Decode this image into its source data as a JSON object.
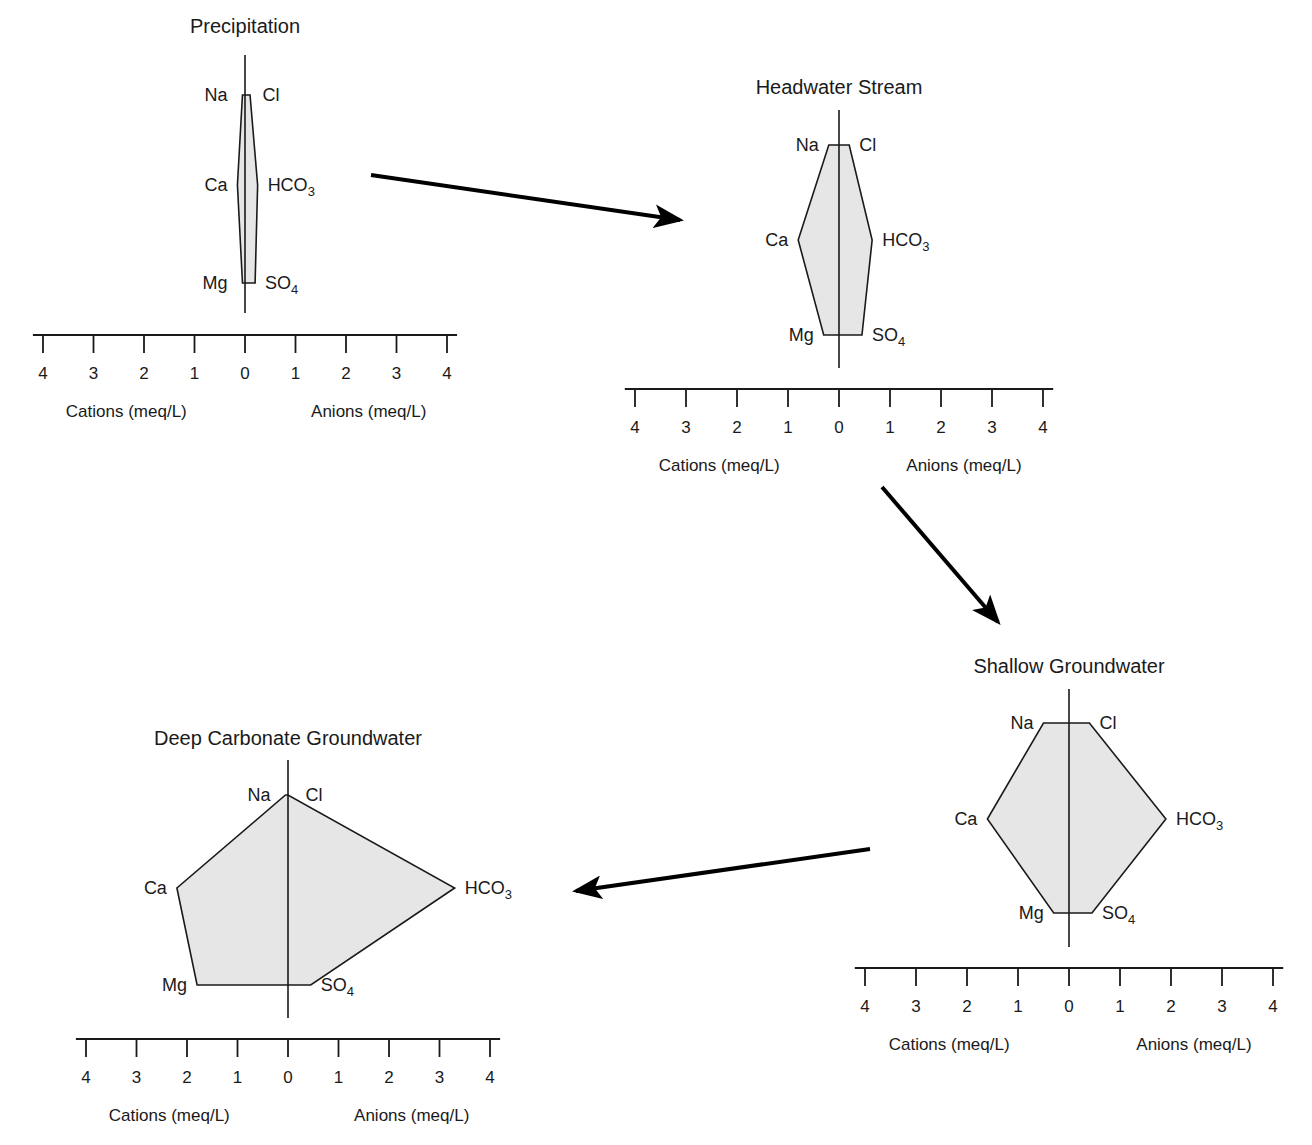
{
  "figure": {
    "ion_order": [
      [
        "Na",
        "Cl"
      ],
      [
        "Ca",
        "HCO3"
      ],
      [
        "Mg",
        "SO4"
      ]
    ],
    "axis": {
      "ticks": [
        "4",
        "3",
        "2",
        "1",
        "0",
        "1",
        "2",
        "3",
        "4"
      ],
      "cation_label": "Cations (meq/L)",
      "anion_label": "Anions (meq/L)"
    },
    "colors": {
      "fill": "#e6e6e6",
      "stroke": "#1a1a1a",
      "arrow": "#000000"
    }
  },
  "chart_data": [
    {
      "type": "stiff",
      "title": "Precipitation",
      "units": "meq/L",
      "xlim": [
        -4,
        4
      ],
      "cations": {
        "Na": 0.05,
        "Ca": 0.15,
        "Mg": 0.05
      },
      "anions": {
        "Cl": 0.1,
        "HCO3": 0.25,
        "SO4": 0.2
      },
      "xlabel_left": "Cations (meq/L)",
      "xlabel_right": "Anions (meq/L)"
    },
    {
      "type": "stiff",
      "title": "Headwater Stream",
      "units": "meq/L",
      "xlim": [
        -4,
        4
      ],
      "cations": {
        "Na": 0.2,
        "Ca": 0.8,
        "Mg": 0.3
      },
      "anions": {
        "Cl": 0.2,
        "HCO3": 0.65,
        "SO4": 0.45
      },
      "xlabel_left": "Cations (meq/L)",
      "xlabel_right": "Anions (meq/L)"
    },
    {
      "type": "stiff",
      "title": "Shallow Groundwater",
      "units": "meq/L",
      "xlim": [
        -4,
        4
      ],
      "cations": {
        "Na": 0.5,
        "Ca": 1.6,
        "Mg": 0.3
      },
      "anions": {
        "Cl": 0.4,
        "HCO3": 1.9,
        "SO4": 0.45
      },
      "xlabel_left": "Cations (meq/L)",
      "xlabel_right": "Anions (meq/L)"
    },
    {
      "type": "stiff",
      "title": "Deep Carbonate Groundwater",
      "units": "meq/L",
      "xlim": [
        -4,
        4
      ],
      "cations": {
        "Na": 0.05,
        "Ca": 2.2,
        "Mg": 1.8
      },
      "anions": {
        "Cl": 0.0,
        "HCO3": 3.3,
        "SO4": 0.45
      },
      "xlabel_left": "Cations (meq/L)",
      "xlabel_right": "Anions (meq/L)"
    }
  ],
  "flow_arrows": [
    {
      "from": "Precipitation",
      "to": "Headwater Stream"
    },
    {
      "from": "Headwater Stream",
      "to": "Shallow Groundwater"
    },
    {
      "from": "Shallow Groundwater",
      "to": "Deep Carbonate Groundwater"
    }
  ]
}
